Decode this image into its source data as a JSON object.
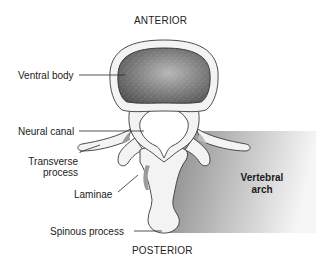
{
  "diagram": {
    "orientation": {
      "top": "ANTERIOR",
      "bottom": "POSTERIOR"
    },
    "labels": [
      {
        "id": "ventral-body",
        "text": "Ventral body"
      },
      {
        "id": "neural-canal",
        "text": "Neural canal"
      },
      {
        "id": "transverse-process",
        "line1": "Transverse",
        "line2": "process"
      },
      {
        "id": "laminae",
        "text": "Laminae"
      },
      {
        "id": "spinous-process",
        "text": "Spinous process"
      }
    ],
    "region": {
      "line1": "Vertebral",
      "line2": "arch"
    },
    "colors": {
      "body_fill": "#6e6e6e",
      "bone": "#f2f2f2",
      "outline": "#3a3a3a",
      "arch_dark": "#8a8a8a",
      "arch_light": "#f4f4f4"
    }
  }
}
